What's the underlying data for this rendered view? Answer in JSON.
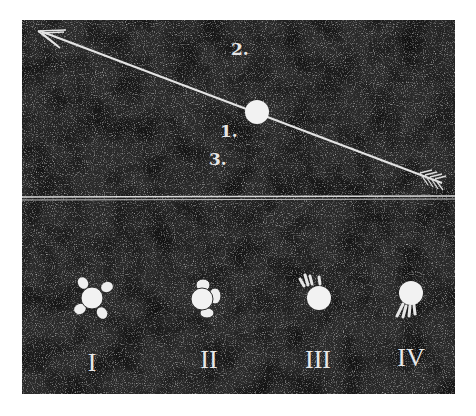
{
  "colors": {
    "background": "#ffffff",
    "panel": "#1e1e1e",
    "chalk": "#ececec",
    "speckle": "#8a8a8a"
  },
  "upper_panel": {
    "description": "Arrow (line of motion) passing through a sphere, with numbered positions",
    "arrow": {
      "tip": [
        38,
        31
      ],
      "tail": [
        445,
        183
      ]
    },
    "sphere": {
      "cx": 257,
      "cy": 112,
      "r": 12
    },
    "labels": [
      {
        "id": "2",
        "text": "2.",
        "x": 231,
        "y": 55
      },
      {
        "id": "1",
        "text": "1.",
        "x": 220,
        "y": 136
      },
      {
        "id": "3",
        "text": "3.",
        "x": 209,
        "y": 165
      }
    ]
  },
  "lower_panel": {
    "description": "Four variants of the sphere with attached features",
    "figures": [
      {
        "id": "I",
        "label": "I",
        "cx": 92,
        "cy": 298,
        "r": 11,
        "style": "four-diagonal-lobes"
      },
      {
        "id": "II",
        "label": "II",
        "cx": 205,
        "cy": 298,
        "r": 12,
        "style": "clustered-lobes"
      },
      {
        "id": "III",
        "label": "III",
        "cx": 319,
        "cy": 298,
        "r": 12,
        "style": "rays-upper-left"
      },
      {
        "id": "IV",
        "label": "IV",
        "cx": 411,
        "cy": 293,
        "r": 12,
        "style": "rays-lower-left"
      }
    ]
  }
}
